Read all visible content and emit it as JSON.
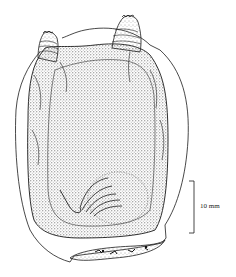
{
  "figure": {
    "scale_bar": {
      "label": "10 mm"
    },
    "colors": {
      "ink": "#1a1a1a",
      "background": "#ffffff",
      "stipple": "#555555"
    }
  }
}
